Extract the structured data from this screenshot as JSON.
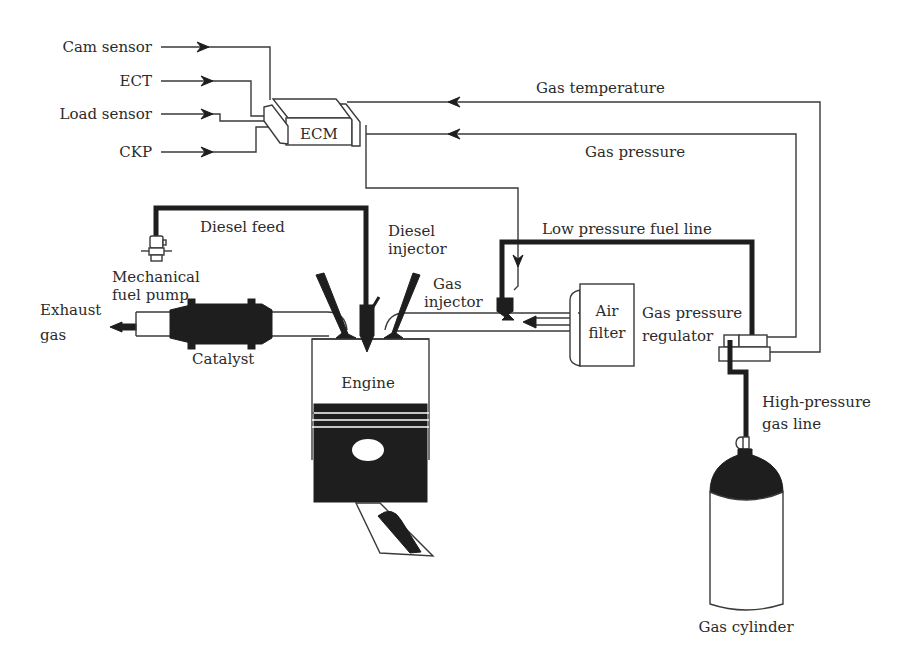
{
  "diagram": {
    "colors": {
      "line": "#3a3a3a",
      "solid": "#1e1e1e",
      "text": "#2b2b2b",
      "background": "#ffffff"
    },
    "ecm": {
      "label": "ECM",
      "inputs": [
        "Cam sensor",
        "ECT",
        "Load sensor",
        "CKP"
      ]
    },
    "signals": {
      "gas_temperature": "Gas temperature",
      "gas_pressure": "Gas pressure"
    },
    "fuel_lines": {
      "diesel_feed": "Diesel feed",
      "low_pressure": "Low pressure fuel line",
      "high_pressure": [
        "High-pressure",
        "gas line"
      ]
    },
    "components": {
      "mechanical_fuel_pump": [
        "Mechanical",
        "fuel pump"
      ],
      "diesel_injector": [
        "Diesel",
        "injector"
      ],
      "gas_injector": [
        "Gas",
        "injector"
      ],
      "air_filter": [
        "Air",
        "filter"
      ],
      "gas_pressure_regulator": [
        "Gas pressure",
        "regulator"
      ],
      "exhaust": [
        "Exhaust",
        "gas"
      ],
      "catalyst": "Catalyst",
      "engine": "Engine",
      "gas_cylinder": "Gas cylinder"
    }
  }
}
